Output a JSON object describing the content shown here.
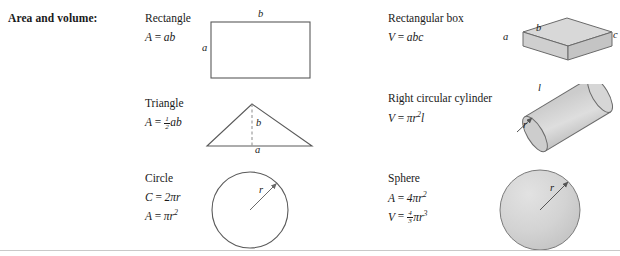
{
  "header": {
    "title": "Area and volume:"
  },
  "colors": {
    "ink": "#1a1a1a",
    "stroke": "#5a5a5a",
    "solid_top_fill": "#d8d8d8",
    "solid_front_fill": "#cfcfcf",
    "solid_side_fill": "#c4c4c4",
    "sphere_fill": "#d2d2d2",
    "rule": "#c9c9c9"
  },
  "left_column": [
    {
      "name": "Rectangle",
      "figure": "rectangle-figure",
      "formulas": [
        {
          "lhs": "A",
          "rel": "=",
          "rhs": "ab"
        }
      ],
      "labels": [
        {
          "text": "b",
          "position": "top"
        },
        {
          "text": "a",
          "position": "left"
        }
      ]
    },
    {
      "name": "Triangle",
      "figure": "triangle-figure",
      "formulas": [
        {
          "lhs": "A",
          "rel": "=",
          "rhs_frac_num": "1",
          "rhs_frac_den": "2",
          "rhs_tail": "ab"
        }
      ],
      "labels": [
        {
          "text": "b",
          "position": "height"
        },
        {
          "text": "a",
          "position": "base"
        }
      ]
    },
    {
      "name": "Circle",
      "figure": "circle-figure",
      "formulas": [
        {
          "lhs": "C",
          "rel": "=",
          "rhs": "2πr"
        },
        {
          "lhs": "A",
          "rel": "=",
          "rhs": "πr",
          "exp": "2"
        }
      ],
      "labels": [
        {
          "text": "r",
          "position": "radius"
        }
      ]
    }
  ],
  "right_column": [
    {
      "name": "Rectangular box",
      "figure": "rectangular-box-figure",
      "formulas": [
        {
          "lhs": "V",
          "rel": "=",
          "rhs": "abc"
        }
      ],
      "labels": [
        {
          "text": "b",
          "position": "top-edge"
        },
        {
          "text": "a",
          "position": "left-edge"
        },
        {
          "text": "c",
          "position": "right-edge"
        }
      ]
    },
    {
      "name": "Right circular cylinder",
      "figure": "cylinder-figure",
      "formulas": [
        {
          "lhs": "V",
          "rel": "=",
          "rhs": "πr",
          "exp": "2",
          "tail": "l"
        }
      ],
      "labels": [
        {
          "text": "l",
          "position": "length"
        },
        {
          "text": "r",
          "position": "radius"
        }
      ]
    },
    {
      "name": "Sphere",
      "figure": "sphere-figure",
      "formulas": [
        {
          "lhs": "A",
          "rel": "=",
          "rhs": "4πr",
          "exp": "2"
        },
        {
          "lhs": "V",
          "rel": "=",
          "rhs_frac_num": "4",
          "rhs_frac_den": "3",
          "rhs_tail": "πr",
          "exp": "3"
        }
      ],
      "labels": [
        {
          "text": "r",
          "position": "radius"
        }
      ]
    }
  ]
}
